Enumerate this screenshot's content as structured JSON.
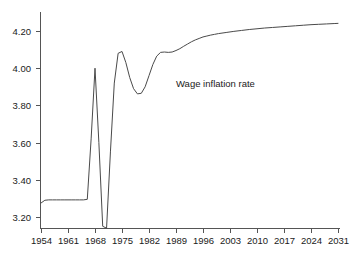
{
  "chart_data": {
    "type": "line",
    "title": "",
    "subtitle": "",
    "xlabel": "",
    "ylabel": "",
    "grid": false,
    "legend_position": "inline-annotation",
    "annotations": [
      {
        "text": "Wage inflation rate",
        "x": 1989,
        "y": 3.9
      }
    ],
    "xlim": [
      1954,
      2031
    ],
    "ylim": [
      3.1,
      4.28
    ],
    "x_ticks": [
      1954,
      1961,
      1968,
      1975,
      1982,
      1989,
      1996,
      2003,
      2010,
      2017,
      2024,
      2031
    ],
    "x_tick_labels": [
      "1954",
      "1961",
      "1968",
      "1975",
      "1982",
      "1989",
      "1996",
      "2003",
      "2010",
      "2017",
      "2024",
      "2031"
    ],
    "y_ticks": [
      3.2,
      3.4,
      3.6,
      3.8,
      4.0,
      4.2
    ],
    "y_tick_labels": [
      "3.20",
      "3.40",
      "3.60",
      "3.80",
      "4.00",
      "4.20"
    ],
    "series": [
      {
        "name": "Wage inflation rate",
        "color": "#4a4a4a",
        "x": [
          1954,
          1955,
          1956,
          1957,
          1958,
          1959,
          1960,
          1961,
          1962,
          1963,
          1964,
          1965,
          1966,
          1967,
          1968,
          1969,
          1970,
          1971,
          1972,
          1973,
          1974,
          1975,
          1976,
          1977,
          1978,
          1979,
          1980,
          1981,
          1982,
          1983,
          1984,
          1985,
          1986,
          1987,
          1988,
          1989,
          1990,
          1991,
          1992,
          1993,
          1994,
          1995,
          1996,
          1997,
          1998,
          1999,
          2000,
          2002,
          2004,
          2006,
          2008,
          2010,
          2012,
          2014,
          2016,
          2018,
          2020,
          2022,
          2024,
          2026,
          2028,
          2030,
          2031
        ],
        "values": [
          3.275,
          3.29,
          3.292,
          3.292,
          3.292,
          3.292,
          3.292,
          3.292,
          3.292,
          3.292,
          3.292,
          3.292,
          3.295,
          3.62,
          4.0,
          3.6,
          3.15,
          3.14,
          3.55,
          3.92,
          4.08,
          4.09,
          4.03,
          3.95,
          3.89,
          3.862,
          3.865,
          3.9,
          3.96,
          4.02,
          4.065,
          4.085,
          4.087,
          4.085,
          4.087,
          4.095,
          4.105,
          4.118,
          4.13,
          4.142,
          4.152,
          4.16,
          4.168,
          4.173,
          4.178,
          4.182,
          4.186,
          4.192,
          4.198,
          4.203,
          4.208,
          4.212,
          4.216,
          4.219,
          4.222,
          4.225,
          4.228,
          4.231,
          4.234,
          4.236,
          4.238,
          4.24,
          4.241
        ]
      }
    ]
  },
  "axes": {
    "y_axis_name": "value-axis",
    "x_axis_name": "year-axis"
  }
}
